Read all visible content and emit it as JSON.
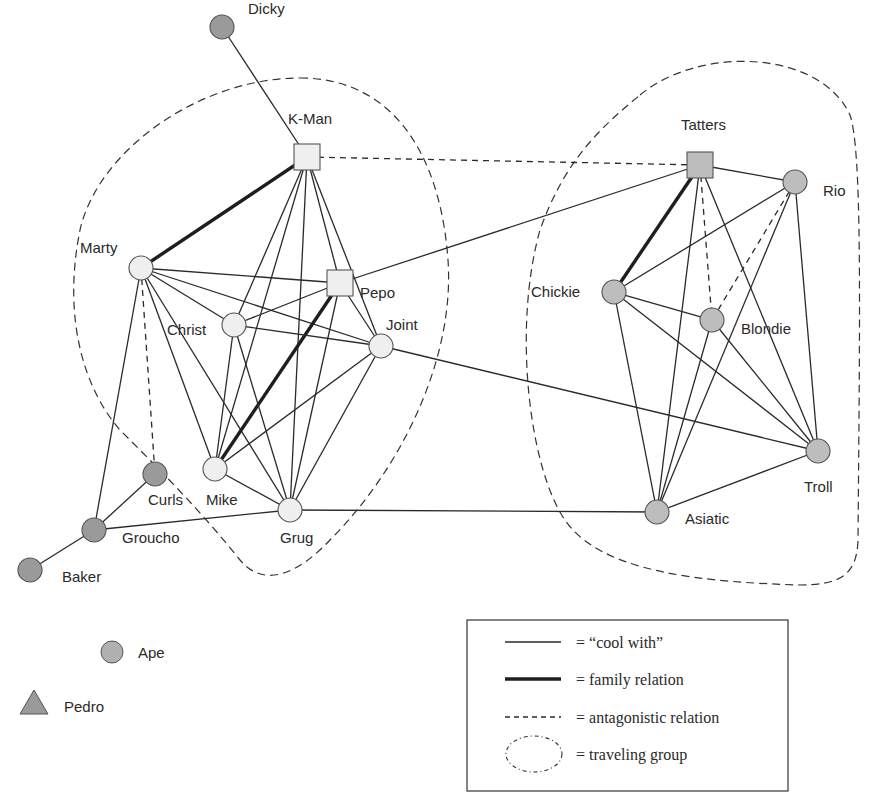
{
  "node_colors": {
    "light": "#efefef",
    "dark": "#9a9a9a",
    "gray": "#bdbdbd",
    "stroke": "#555555"
  },
  "nodes": [
    {
      "id": "Dicky",
      "label": "Dicky",
      "x": 222,
      "y": 27,
      "shape": "circle",
      "fill": "dark",
      "lx": 248,
      "ly": 14
    },
    {
      "id": "K-Man",
      "label": "K-Man",
      "x": 307,
      "y": 157,
      "shape": "square",
      "fill": "light",
      "lx": 288,
      "ly": 124
    },
    {
      "id": "Marty",
      "label": "Marty",
      "x": 141,
      "y": 268,
      "shape": "circle",
      "fill": "light",
      "lx": 80,
      "ly": 253
    },
    {
      "id": "Pepo",
      "label": "Pepo",
      "x": 340,
      "y": 283,
      "shape": "square",
      "fill": "light",
      "lx": 360,
      "ly": 298
    },
    {
      "id": "Christ",
      "label": "Christ",
      "x": 234,
      "y": 325,
      "shape": "circle",
      "fill": "light",
      "lx": 167,
      "ly": 335
    },
    {
      "id": "Joint",
      "label": "Joint",
      "x": 381,
      "y": 346,
      "shape": "circle",
      "fill": "light",
      "lx": 386,
      "ly": 330
    },
    {
      "id": "Mike",
      "label": "Mike",
      "x": 215,
      "y": 469,
      "shape": "circle",
      "fill": "light",
      "lx": 206,
      "ly": 505
    },
    {
      "id": "Curls",
      "label": "Curls",
      "x": 155,
      "y": 474,
      "shape": "circle",
      "fill": "dark",
      "lx": 148,
      "ly": 505
    },
    {
      "id": "Grug",
      "label": "Grug",
      "x": 290,
      "y": 510,
      "shape": "circle",
      "fill": "light",
      "lx": 280,
      "ly": 543
    },
    {
      "id": "Groucho",
      "label": "Groucho",
      "x": 94,
      "y": 530,
      "shape": "circle",
      "fill": "dark",
      "lx": 122,
      "ly": 543
    },
    {
      "id": "Baker",
      "label": "Baker",
      "x": 30,
      "y": 570,
      "shape": "circle",
      "fill": "dark",
      "lx": 62,
      "ly": 582
    },
    {
      "id": "Tatters",
      "label": "Tatters",
      "x": 700,
      "y": 165,
      "shape": "square",
      "fill": "gray",
      "lx": 681,
      "ly": 130
    },
    {
      "id": "Rio",
      "label": "Rio",
      "x": 795,
      "y": 182,
      "shape": "circle",
      "fill": "gray",
      "lx": 823,
      "ly": 196
    },
    {
      "id": "Chickie",
      "label": "Chickie",
      "x": 614,
      "y": 292,
      "shape": "circle",
      "fill": "gray",
      "lx": 531,
      "ly": 297
    },
    {
      "id": "Blondie",
      "label": "Blondie",
      "x": 712,
      "y": 320,
      "shape": "circle",
      "fill": "gray",
      "lx": 741,
      "ly": 334
    },
    {
      "id": "Troll",
      "label": "Troll",
      "x": 818,
      "y": 451,
      "shape": "circle",
      "fill": "gray",
      "lx": 804,
      "ly": 492
    },
    {
      "id": "Asiatic",
      "label": "Asiatic",
      "x": 657,
      "y": 512,
      "shape": "circle",
      "fill": "gray",
      "lx": 685,
      "ly": 524
    }
  ],
  "edges": [
    {
      "a": "Dicky",
      "b": "K-Man",
      "type": "cool"
    },
    {
      "a": "K-Man",
      "b": "Marty",
      "type": "family"
    },
    {
      "a": "K-Man",
      "b": "Tatters",
      "type": "antag"
    },
    {
      "a": "K-Man",
      "b": "Christ",
      "type": "cool"
    },
    {
      "a": "K-Man",
      "b": "Mike",
      "type": "cool"
    },
    {
      "a": "K-Man",
      "b": "Grug",
      "type": "cool"
    },
    {
      "a": "K-Man",
      "b": "Pepo",
      "type": "cool"
    },
    {
      "a": "K-Man",
      "b": "Joint",
      "type": "cool"
    },
    {
      "a": "Marty",
      "b": "Pepo",
      "type": "cool"
    },
    {
      "a": "Marty",
      "b": "Christ",
      "type": "cool"
    },
    {
      "a": "Marty",
      "b": "Joint",
      "type": "cool"
    },
    {
      "a": "Marty",
      "b": "Mike",
      "type": "cool"
    },
    {
      "a": "Marty",
      "b": "Grug",
      "type": "cool"
    },
    {
      "a": "Marty",
      "b": "Groucho",
      "type": "cool"
    },
    {
      "a": "Marty",
      "b": "Curls",
      "type": "antag"
    },
    {
      "a": "Pepo",
      "b": "Christ",
      "type": "cool"
    },
    {
      "a": "Pepo",
      "b": "Joint",
      "type": "cool"
    },
    {
      "a": "Pepo",
      "b": "Mike",
      "type": "family"
    },
    {
      "a": "Pepo",
      "b": "Grug",
      "type": "cool"
    },
    {
      "a": "Pepo",
      "b": "Tatters",
      "type": "cool"
    },
    {
      "a": "Christ",
      "b": "Joint",
      "type": "cool"
    },
    {
      "a": "Christ",
      "b": "Mike",
      "type": "cool"
    },
    {
      "a": "Christ",
      "b": "Grug",
      "type": "cool"
    },
    {
      "a": "Joint",
      "b": "Mike",
      "type": "cool"
    },
    {
      "a": "Joint",
      "b": "Grug",
      "type": "cool"
    },
    {
      "a": "Joint",
      "b": "Troll",
      "type": "cool"
    },
    {
      "a": "Mike",
      "b": "Grug",
      "type": "cool"
    },
    {
      "a": "Grug",
      "b": "Groucho",
      "type": "cool"
    },
    {
      "a": "Grug",
      "b": "Asiatic",
      "type": "cool"
    },
    {
      "a": "Curls",
      "b": "Groucho",
      "type": "cool"
    },
    {
      "a": "Groucho",
      "b": "Baker",
      "type": "cool"
    },
    {
      "a": "Tatters",
      "b": "Rio",
      "type": "cool"
    },
    {
      "a": "Tatters",
      "b": "Chickie",
      "type": "family"
    },
    {
      "a": "Tatters",
      "b": "Blondie",
      "type": "antag"
    },
    {
      "a": "Tatters",
      "b": "Asiatic",
      "type": "cool"
    },
    {
      "a": "Tatters",
      "b": "Troll",
      "type": "cool"
    },
    {
      "a": "Rio",
      "b": "Chickie",
      "type": "cool"
    },
    {
      "a": "Rio",
      "b": "Blondie",
      "type": "antag"
    },
    {
      "a": "Rio",
      "b": "Asiatic",
      "type": "cool"
    },
    {
      "a": "Rio",
      "b": "Troll",
      "type": "cool"
    },
    {
      "a": "Chickie",
      "b": "Blondie",
      "type": "cool"
    },
    {
      "a": "Chickie",
      "b": "Asiatic",
      "type": "cool"
    },
    {
      "a": "Chickie",
      "b": "Troll",
      "type": "cool"
    },
    {
      "a": "Blondie",
      "b": "Asiatic",
      "type": "cool"
    },
    {
      "a": "Blondie",
      "b": "Troll",
      "type": "cool"
    },
    {
      "a": "Asiatic",
      "b": "Troll",
      "type": "cool"
    }
  ],
  "groups": [
    {
      "name": "left-traveling-group",
      "path": "M 300 78 C 390 78 440 150 448 260 C 455 360 400 470 330 540 C 300 572 265 590 240 560 C 200 510 160 470 120 430 C 85 390 62 320 80 230 C 98 150 200 78 300 78 Z"
    },
    {
      "name": "right-traveling-group",
      "path": "M 640 95 C 700 45 820 50 850 115 C 862 150 860 300 858 540 C 857 575 840 585 800 585 C 700 582 600 572 565 520 C 530 470 512 330 540 230 C 565 160 600 128 640 95 Z"
    }
  ],
  "key": {
    "ape": {
      "label": "Ape",
      "x": 112,
      "y": 652,
      "lx": 138,
      "ly": 658
    },
    "pedro": {
      "label": "Pedro",
      "x": 34,
      "y": 703,
      "lx": 64,
      "ly": 712
    }
  },
  "legend": {
    "box": {
      "x": 467,
      "y": 620,
      "w": 321,
      "h": 171
    },
    "items": [
      {
        "type": "cool",
        "text": "= “cool with”"
      },
      {
        "type": "family",
        "text": "= family relation"
      },
      {
        "type": "antag",
        "text": "= antagonistic relation"
      },
      {
        "type": "group",
        "text": "= traveling group"
      }
    ]
  }
}
